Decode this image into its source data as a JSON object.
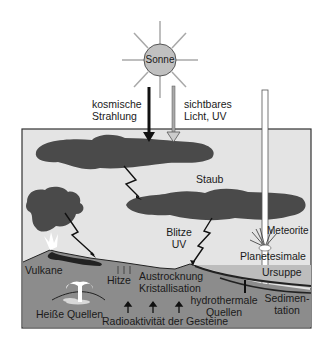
{
  "diagram": {
    "type": "early-earth-energy-sources",
    "colors": {
      "sky": "#e4e4e4",
      "cloud": "#4a4a4a",
      "ground": "#8c8c8c",
      "ursuppe": "#bdbdbd",
      "sun": "#c0c0c0",
      "frame": "#333333"
    },
    "sun": {
      "label": "Sonne"
    },
    "labels": {
      "cosmic": [
        "kosmische",
        "Strahlung"
      ],
      "visible": [
        "sichtbares",
        "Licht, UV"
      ],
      "dust": "Staub",
      "lightning": [
        "Blitze",
        "UV"
      ],
      "meteorite": "Meteorite",
      "planetesimals": "Planetesimale",
      "volcano": "Vulkane",
      "heat": "Hitze",
      "drying": [
        "Austrocknung",
        "Kristallisation"
      ],
      "ursuppe": "Ursuppe",
      "hydrothermal": [
        "hydrothermale",
        "Quellen"
      ],
      "sedimentation": [
        "Sedimen-",
        "tation"
      ],
      "hot_springs": "Heiße Quellen",
      "radioactivity": "Radioaktivität der Gesteine"
    }
  }
}
